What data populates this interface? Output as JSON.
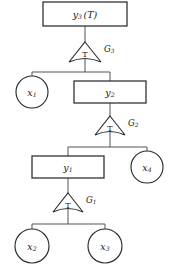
{
  "diagram": {
    "type": "hierarchical-transform-tree",
    "orientation": "top-down",
    "colors": {
      "background": "#ffffff",
      "node_stroke": "#2b2b2b",
      "edge_stroke": "#4a4a4a",
      "text": "#1a1a1a"
    },
    "levels": [
      {
        "index": 0,
        "output_node": "y3",
        "transform": "G3",
        "children": [
          "x1",
          "y2"
        ]
      },
      {
        "index": 1,
        "output_node": "y2",
        "transform": "G2",
        "children": [
          "y1",
          "x4"
        ]
      },
      {
        "index": 2,
        "output_node": "y1",
        "transform": "G1",
        "children": [
          "x2",
          "x3"
        ]
      }
    ],
    "nodes": {
      "y3": {
        "id": "y3",
        "shape": "rectangle",
        "base": "y",
        "subscript": "3",
        "annotation": "(T)",
        "full_label": "y3 (T)",
        "x": 85,
        "y": 14,
        "width": 84,
        "height": 24
      },
      "y2": {
        "id": "y2",
        "shape": "rectangle",
        "base": "y",
        "subscript": "2",
        "annotation": "",
        "full_label": "y2",
        "x": 110,
        "y": 92,
        "width": 72,
        "height": 22
      },
      "y1": {
        "id": "y1",
        "shape": "rectangle",
        "base": "y",
        "subscript": "1",
        "annotation": "",
        "full_label": "y1",
        "x": 68,
        "y": 167,
        "width": 72,
        "height": 22
      },
      "x1": {
        "id": "x1",
        "shape": "circle",
        "base": "x",
        "subscript": "1",
        "full_label": "x1",
        "x": 32,
        "y": 92,
        "radius": 16
      },
      "x4": {
        "id": "x4",
        "shape": "circle",
        "base": "x",
        "subscript": "4",
        "full_label": "x4",
        "x": 147,
        "y": 167,
        "radius": 16
      },
      "x2": {
        "id": "x2",
        "shape": "circle",
        "base": "x",
        "subscript": "2",
        "full_label": "x2",
        "x": 32,
        "y": 246,
        "radius": 17
      },
      "x3": {
        "id": "x3",
        "shape": "circle",
        "base": "x",
        "subscript": "3",
        "full_label": "x3",
        "x": 105,
        "y": 246,
        "radius": 17
      }
    },
    "transforms": {
      "G3": {
        "id": "G3",
        "shape": "triangle-curved-base",
        "inner_label": "T",
        "base": "G",
        "subscript": "3",
        "full_label": "G3",
        "apex_x": 85,
        "apex_y": 42,
        "half_width": 16,
        "base_y": 62,
        "label_x": 104,
        "label_y": 49
      },
      "G2": {
        "id": "G2",
        "shape": "triangle-curved-base",
        "inner_label": "T",
        "base": "G",
        "subscript": "2",
        "full_label": "G2",
        "apex_x": 110,
        "apex_y": 116,
        "half_width": 15,
        "base_y": 135,
        "label_x": 128,
        "label_y": 123
      },
      "G1": {
        "id": "G1",
        "shape": "triangle-curved-base",
        "inner_label": "T",
        "base": "G",
        "subscript": "1",
        "full_label": "G1",
        "apex_x": 68,
        "apex_y": 193,
        "half_width": 15,
        "base_y": 212,
        "label_x": 86,
        "label_y": 200
      }
    }
  }
}
